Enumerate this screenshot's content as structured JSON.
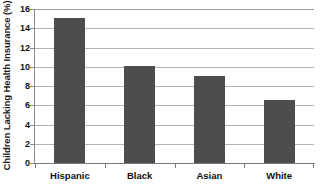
{
  "chart_data": {
    "type": "bar",
    "title": "",
    "subtitle": "",
    "xlabel": "",
    "ylabel": "Children Lacking Health Insurance (%)",
    "categories": [
      "Hispanic",
      "Black",
      "Asian",
      "White"
    ],
    "values": [
      15.1,
      10.1,
      9.0,
      6.5
    ],
    "ylim": [
      0,
      16
    ],
    "ytick_step": 2,
    "yticks": [
      16,
      14,
      12,
      10,
      8,
      6,
      4,
      2,
      0
    ],
    "ytick_labels": [
      "16",
      "14",
      "12",
      "10",
      "8",
      "6",
      "4",
      "2",
      "0"
    ],
    "grid": "horizontal",
    "legend": "none",
    "bar_color": "#4d4d4d",
    "gridline_color": "#b4b4b4",
    "axis_color": "#7a7a7a",
    "background_color": "#ffffff"
  }
}
